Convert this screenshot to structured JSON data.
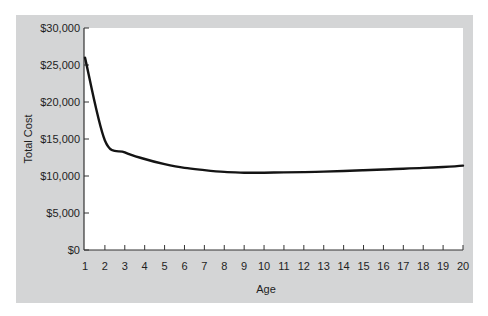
{
  "chart_data": {
    "type": "line",
    "title": "",
    "xlabel": "Age",
    "ylabel": "Total Cost",
    "x": [
      1,
      2,
      3,
      4,
      5,
      6,
      7,
      8,
      9,
      10,
      11,
      12,
      13,
      14,
      15,
      16,
      17,
      18,
      19,
      20
    ],
    "series": [
      {
        "name": "Total Cost",
        "values": [
          26000,
          14800,
          13200,
          12300,
          11600,
          11100,
          10800,
          10550,
          10450,
          10450,
          10480,
          10530,
          10600,
          10680,
          10780,
          10880,
          10990,
          11100,
          11220,
          11400
        ]
      }
    ],
    "x_tick_labels": [
      "1",
      "2",
      "3",
      "4",
      "5",
      "6",
      "7",
      "8",
      "9",
      "10",
      "11",
      "12",
      "13",
      "14",
      "15",
      "16",
      "17",
      "18",
      "19",
      "20"
    ],
    "y_tick_labels": [
      "$0",
      "$5,000",
      "$10,000",
      "$15,000",
      "$20,000",
      "$25,000",
      "$30,000"
    ],
    "y_ticks": [
      0,
      5000,
      10000,
      15000,
      20000,
      25000,
      30000
    ],
    "xlim": [
      1,
      20
    ],
    "ylim": [
      0,
      30000
    ],
    "grid": false,
    "legend": null,
    "colors": {
      "panel": "#d4d5d6",
      "plot_bg": "#ffffff",
      "line": "#141414"
    }
  }
}
